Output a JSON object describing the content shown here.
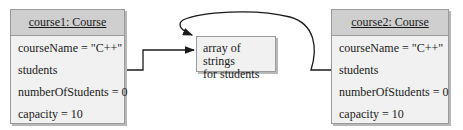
{
  "objects": [
    {
      "header": "course1: Course",
      "fields": [
        "courseName = \"C++\"",
        "students",
        "numberOfStudents = 0",
        "capacity = 10"
      ]
    },
    {
      "header": "course2: Course",
      "fields": [
        "courseName = \"C++\"",
        "students",
        "numberOfStudents = 0",
        "capacity = 10"
      ]
    }
  ],
  "array_box": {
    "line1": "array of strings",
    "line2": "for students"
  }
}
